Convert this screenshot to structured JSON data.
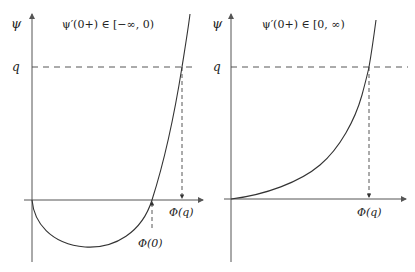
{
  "left_panel": {
    "title": "ψ′(0+) ∈ [−∞, 0)",
    "y_label": "ψ",
    "q_label": "q",
    "phi_q_label": "Φ(q)",
    "phi_0_label": "Φ(0)"
  },
  "right_panel": {
    "title": "ψ′(0+) ∈ [0, ∞)",
    "y_label": "ψ",
    "q_label": "q",
    "phi_q_label": "Φ(q)"
  },
  "colors": {
    "axis": "#555555",
    "curve": "#333333",
    "dashed": "#444444"
  }
}
